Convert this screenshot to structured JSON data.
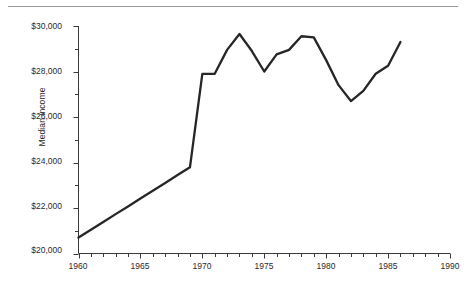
{
  "chart_data": {
    "type": "line",
    "title": "",
    "xlabel": "",
    "ylabel": "Median income",
    "xlim": [
      1960,
      1990
    ],
    "ylim": [
      20000,
      30000
    ],
    "grid": false,
    "legend": null,
    "x_major_ticks": [
      1960,
      1965,
      1970,
      1975,
      1980,
      1985,
      1990
    ],
    "x_tick_labels": [
      "1960",
      "1965",
      "1970",
      "1975",
      "1980",
      "1985",
      "1990"
    ],
    "x_minor_tick_step": 1,
    "y_major_ticks": [
      20000,
      22000,
      24000,
      26000,
      28000,
      30000
    ],
    "y_tick_labels": [
      "$20,000",
      "$22,000",
      "$24,000",
      "$26,000",
      "$28,000",
      "$30,000"
    ],
    "y_minor_tick_step": 1000,
    "series": [
      {
        "name": "Median income",
        "color": "#262626",
        "x": [
          1960,
          1961,
          1962,
          1963,
          1964,
          1965,
          1966,
          1967,
          1968,
          1969,
          1970,
          1971,
          1972,
          1973,
          1974,
          1975,
          1976,
          1977,
          1978,
          1979,
          1980,
          1981,
          1982,
          1983,
          1984,
          1985,
          1986
        ],
        "values": [
          20700,
          21040,
          21380,
          21730,
          22070,
          22420,
          22760,
          23100,
          23450,
          23790,
          27900,
          27900,
          28950,
          29650,
          28900,
          28000,
          28750,
          28950,
          29550,
          29500,
          28500,
          27400,
          26700,
          27150,
          27900,
          28250,
          29300
        ]
      }
    ]
  },
  "figure": {
    "top_rule": "horizontal-rule"
  }
}
